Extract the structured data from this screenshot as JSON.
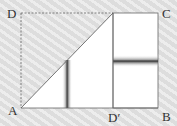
{
  "diagram": {
    "type": "geometry-fold",
    "labels": {
      "A": "A",
      "B": "B",
      "C": "C",
      "D": "D",
      "D_prime": "D′"
    },
    "points": {
      "A": [
        21,
        108
      ],
      "B": [
        158,
        108
      ],
      "C": [
        158,
        13
      ],
      "D": [
        21,
        13
      ],
      "D_prime": [
        113,
        108
      ],
      "fold_top": [
        113,
        13
      ]
    },
    "colors": {
      "background": "#e4e4e4",
      "fill": "#ffffff",
      "line": "#555555",
      "shade": "#444444"
    }
  }
}
